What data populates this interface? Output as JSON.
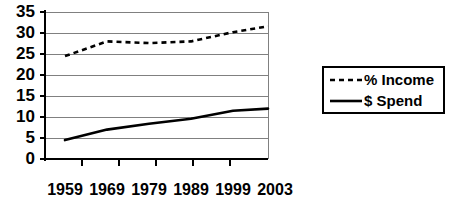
{
  "chart_data": {
    "type": "line",
    "title": "",
    "subtitle": "",
    "xlabel": "",
    "ylabel": "",
    "x": [
      "1959",
      "1969",
      "1979",
      "1989",
      "1999",
      "2003"
    ],
    "categories": [
      "1959",
      "1969",
      "1979",
      "1989",
      "1999",
      "2003"
    ],
    "series": [
      {
        "name": "% Income",
        "style": "dashed",
        "color": "#000000",
        "values": [
          24.5,
          28.0,
          27.6,
          28.0,
          30.2,
          31.6
        ]
      },
      {
        "name": "$ Spend",
        "style": "solid",
        "color": "#000000",
        "values": [
          4.5,
          7.0,
          8.4,
          9.6,
          11.5,
          12.0
        ]
      }
    ],
    "ylim": [
      0,
      35
    ],
    "yticks": [
      0,
      5,
      10,
      15,
      20,
      25,
      30,
      35
    ],
    "ytick_labels": [
      "0",
      "5",
      "10",
      "15",
      "20",
      "25",
      "30",
      "35"
    ],
    "xtick_labels": [
      "1959",
      "1969",
      "1979",
      "1989",
      "1999",
      "2003"
    ],
    "grid": true,
    "grid_axis": "y",
    "grid_color": "#808080",
    "legend_position": "right",
    "legend_entries": [
      {
        "label": "% Income",
        "style": "dashed"
      },
      {
        "label": "$ Spend",
        "style": "solid"
      }
    ],
    "background_color": "#ffffff",
    "axis_color": "#000000"
  }
}
